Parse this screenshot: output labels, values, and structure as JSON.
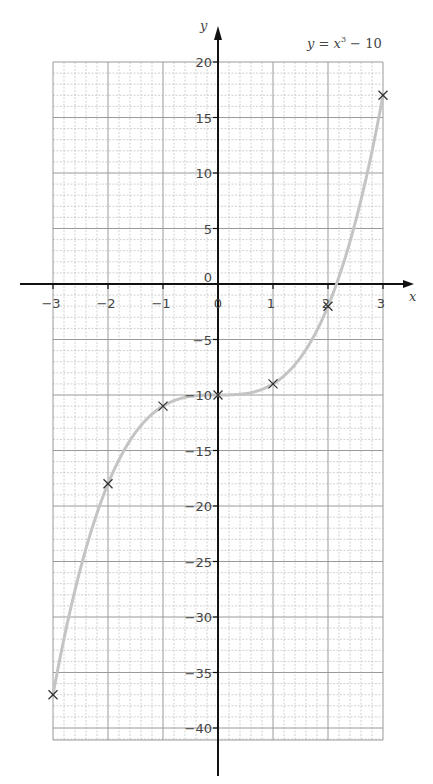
{
  "chart_data": {
    "type": "line",
    "title": "",
    "annotation": "y = x³ − 10",
    "xlabel": "x",
    "ylabel": "y",
    "xlim": [
      -3,
      3
    ],
    "ylim": [
      -40,
      20
    ],
    "grid": true,
    "x_ticks": [
      -3,
      -2,
      -1,
      0,
      1,
      2,
      3
    ],
    "x_tick_labels": [
      "−3",
      "−2",
      "−1",
      "0",
      "1",
      "2",
      "3"
    ],
    "y_ticks": [
      20,
      15,
      10,
      5,
      0,
      -5,
      -10,
      -15,
      -20,
      -25,
      -30,
      -35,
      -40
    ],
    "y_tick_labels": [
      "20",
      "15",
      "10",
      "5",
      "0",
      "−5",
      "−10",
      "−15",
      "−20",
      "−25",
      "−30",
      "−35",
      "−40"
    ],
    "series": [
      {
        "name": "y = x³ − 10",
        "function": "x^3 - 10",
        "style": "smooth curve",
        "color": "#c4c4c4"
      }
    ],
    "plotted_points": {
      "x": [
        -3,
        -2,
        -1,
        0,
        1,
        2,
        3
      ],
      "y": [
        -37,
        -18,
        -11,
        -10,
        -9,
        -2,
        17
      ],
      "marker": "x"
    }
  },
  "labels": {
    "equation_y": "y",
    "equation_rest": " = ",
    "equation_x": "x",
    "equation_exp": "3",
    "equation_tail": " − 10",
    "x_axis": "x",
    "y_axis": "y"
  },
  "colors": {
    "axis": "#111111",
    "major_grid": "#9a9a9a",
    "minor_grid": "#bdbdbd",
    "curve": "#c4c4c4",
    "marker": "#333333"
  }
}
